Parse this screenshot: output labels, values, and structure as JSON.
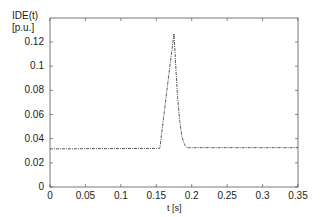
{
  "chart_data": {
    "type": "line",
    "title": "",
    "ylabel": "IDE(t)",
    "ylabel_unit": "[p.u.]",
    "xlabel": "t [s]",
    "xlim": [
      0,
      0.35
    ],
    "ylim": [
      0,
      0.13
    ],
    "grid": false,
    "legend": null,
    "xticks": [
      "0",
      "0.05",
      "0.1",
      "0.15",
      "0.2",
      "0.25",
      "0.3",
      "0.35"
    ],
    "yticks": [
      "0",
      "0.02",
      "0.04",
      "0.06",
      "0.08",
      "0.1",
      "0.12"
    ],
    "series": [
      {
        "name": "IDE(t)",
        "style": "dash-dot",
        "x": [
          0,
          0.05,
          0.1,
          0.155,
          0.16,
          0.165,
          0.17,
          0.175,
          0.178,
          0.18,
          0.183,
          0.186,
          0.19,
          0.193,
          0.2,
          0.25,
          0.3,
          0.35
        ],
        "y": [
          0.0315,
          0.0317,
          0.0318,
          0.032,
          0.056,
          0.08,
          0.104,
          0.127,
          0.095,
          0.075,
          0.055,
          0.042,
          0.035,
          0.0325,
          0.0325,
          0.0325,
          0.0325,
          0.0325
        ]
      }
    ]
  }
}
